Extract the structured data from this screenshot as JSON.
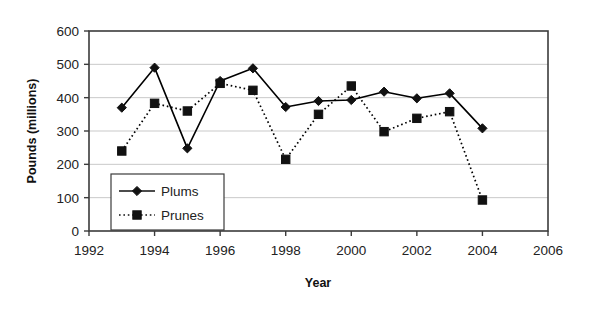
{
  "chart_data": {
    "type": "line",
    "title": "",
    "xlabel": "Year",
    "ylabel": "Pounds (millions)",
    "xlim": [
      1992,
      2006
    ],
    "ylim": [
      0,
      600
    ],
    "xticks": [
      1992,
      1994,
      1996,
      1998,
      2000,
      2002,
      2004,
      2006
    ],
    "yticks": [
      0,
      100,
      200,
      300,
      400,
      500,
      600
    ],
    "grid": "horizontal",
    "legend_position": "lower-left-inside",
    "x": [
      1993,
      1994,
      1995,
      1996,
      1997,
      1998,
      1999,
      2000,
      2001,
      2002,
      2003,
      2004
    ],
    "series": [
      {
        "name": "Plums",
        "marker": "diamond",
        "line_style": "solid",
        "color": "#000000",
        "values": [
          370,
          490,
          248,
          450,
          488,
          372,
          390,
          393,
          418,
          398,
          413,
          308
        ]
      },
      {
        "name": "Prunes",
        "marker": "square",
        "line_style": "dotted",
        "color": "#000000",
        "values": [
          240,
          383,
          360,
          443,
          422,
          215,
          350,
          435,
          298,
          338,
          358,
          93
        ]
      }
    ]
  },
  "axes": {
    "y_tick_labels": [
      "600",
      "500",
      "400",
      "300",
      "200",
      "100",
      "0"
    ],
    "x_tick_labels": [
      "1992",
      "1994",
      "1996",
      "1998",
      "2000",
      "2002",
      "2004",
      "2006"
    ],
    "y_axis_title": "Pounds (millions)",
    "x_axis_title": "Year"
  },
  "legend": {
    "entries": [
      {
        "label": "Plums",
        "marker": "diamond",
        "line_style": "solid"
      },
      {
        "label": "Prunes",
        "marker": "square",
        "line_style": "dotted"
      }
    ]
  },
  "colors": {
    "plot_border": "#3b3b3b",
    "gridline": "#c9c9c9",
    "series_ink": "#111111",
    "background": "#ffffff",
    "text": "#222222"
  }
}
